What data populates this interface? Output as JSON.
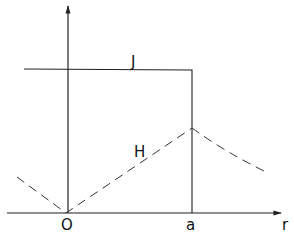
{
  "diagram": {
    "axes": {
      "x_label": "r",
      "origin_label": "O",
      "tick_label": "a"
    },
    "curves": {
      "current_density_label": "J",
      "magnetic_field_label": "H"
    },
    "colors": {
      "line": "#222222",
      "background": "#ffffff"
    }
  }
}
